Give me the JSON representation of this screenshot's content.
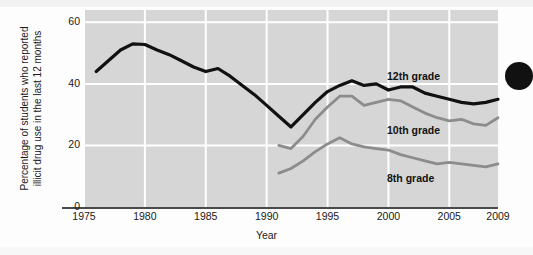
{
  "figure": {
    "background_color": "#d6d6d6",
    "page_color": "#fdfdfd",
    "gridline_color": "#ffffff",
    "axis_color": "#4a4a4a",
    "page_dot_name": "page-edge-dot"
  },
  "axes": {
    "x_title": "Year",
    "y_title_line1": "Percentage of students who reported",
    "y_title_line2": "illicit drug use in the last 12 months",
    "x_ticks": [
      "1975",
      "1980",
      "1985",
      "1990",
      "1995",
      "2000",
      "2005",
      "2009"
    ],
    "y_ticks": [
      "60",
      "40",
      "20",
      "0"
    ]
  },
  "labels": {
    "grade12": "12th grade",
    "grade10": "10th grade",
    "grade8": "8th grade"
  },
  "chart_data": {
    "type": "line",
    "title": "",
    "xlabel": "Year",
    "ylabel": "Percentage of students who reported illicit drug use in the last 12 months",
    "xlim": [
      1975,
      2009
    ],
    "ylim": [
      0,
      64
    ],
    "xticks": [
      1975,
      1980,
      1985,
      1990,
      1995,
      2000,
      2005,
      2009
    ],
    "yticks": [
      0,
      20,
      40,
      60
    ],
    "grid": "both-white",
    "legend_position": "inline-right",
    "colors": {
      "12th grade": "#111111",
      "10th grade": "#8c8c8c",
      "8th grade": "#8c8c8c"
    },
    "series": [
      {
        "name": "12th grade",
        "color": "#111111",
        "x": [
          1976,
          1977,
          1978,
          1979,
          1980,
          1981,
          1982,
          1983,
          1984,
          1985,
          1986,
          1987,
          1988,
          1989,
          1990,
          1991,
          1992,
          1993,
          1994,
          1995,
          1996,
          1997,
          1998,
          1999,
          2000,
          2001,
          2002,
          2003,
          2004,
          2005,
          2006,
          2007,
          2008,
          2009
        ],
        "values": [
          44.0,
          47.5,
          51.0,
          53.0,
          52.8,
          51.0,
          49.5,
          47.5,
          45.5,
          44.0,
          45.0,
          42.5,
          39.5,
          36.5,
          33.0,
          29.5,
          26.0,
          30.0,
          34.0,
          37.5,
          39.5,
          41.0,
          39.5,
          40.0,
          38.0,
          39.0,
          39.0,
          37.0,
          36.0,
          35.0,
          34.0,
          33.5,
          34.0,
          35.0
        ]
      },
      {
        "name": "10th grade",
        "color": "#8c8c8c",
        "x": [
          1991,
          1992,
          1993,
          1994,
          1995,
          1996,
          1997,
          1998,
          1999,
          2000,
          2001,
          2002,
          2003,
          2004,
          2005,
          2006,
          2007,
          2008,
          2009
        ],
        "values": [
          20.0,
          19.0,
          23.0,
          28.5,
          32.5,
          36.0,
          36.0,
          33.0,
          34.0,
          35.0,
          34.5,
          32.5,
          30.5,
          29.0,
          28.0,
          28.5,
          27.0,
          26.5,
          29.0
        ]
      },
      {
        "name": "8th grade",
        "color": "#8c8c8c",
        "x": [
          1991,
          1992,
          1993,
          1994,
          1995,
          1996,
          1997,
          1998,
          1999,
          2000,
          2001,
          2002,
          2003,
          2004,
          2005,
          2006,
          2007,
          2008,
          2009
        ],
        "values": [
          11.0,
          12.5,
          15.0,
          18.0,
          20.5,
          22.5,
          20.5,
          19.5,
          19.0,
          18.5,
          17.0,
          16.0,
          15.0,
          14.0,
          14.5,
          14.0,
          13.5,
          13.0,
          14.0
        ]
      }
    ]
  }
}
